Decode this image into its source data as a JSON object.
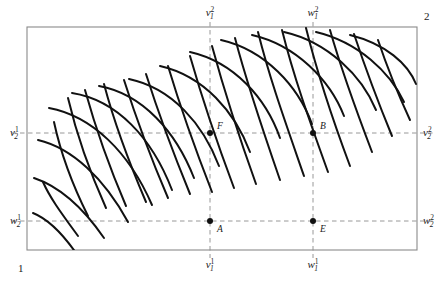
{
  "figure": {
    "frame": {
      "x": 27,
      "y": 27,
      "width": 390,
      "height": 223,
      "stroke": "#8a8a8a"
    },
    "colors": {
      "curve": "#111111",
      "dashed": "#8c8c8c",
      "frame": "#8a8a8a",
      "text": "#1a1a1a",
      "background": "#ffffff"
    },
    "corner_labels": [
      {
        "name": "origin-agent-1",
        "text": "1",
        "x": 18,
        "y": 272
      },
      {
        "name": "origin-agent-2",
        "text": "2",
        "x": 424,
        "y": 20
      }
    ],
    "axis_labels": {
      "top": [
        {
          "name": "v1-superscript-2",
          "base": "v",
          "sub": "1",
          "sup": "2",
          "x": 210,
          "y": 16
        },
        {
          "name": "w1-superscript-2",
          "base": "w",
          "sub": "1",
          "sup": "2",
          "x": 313,
          "y": 16
        }
      ],
      "bottom": [
        {
          "name": "v1-superscript-1",
          "base": "v",
          "sub": "1",
          "sup": "1",
          "x": 210,
          "y": 268
        },
        {
          "name": "w1-superscript-1",
          "base": "w",
          "sub": "1",
          "sup": "1",
          "x": 313,
          "y": 268
        }
      ],
      "left": [
        {
          "name": "v2-superscript-1",
          "base": "v",
          "sub": "2",
          "sup": "1",
          "x": 10,
          "y": 136
        },
        {
          "name": "w2-superscript-1",
          "base": "w",
          "sub": "2",
          "sup": "1",
          "x": 10,
          "y": 224
        }
      ],
      "right": [
        {
          "name": "v2-superscript-2",
          "base": "v",
          "sub": "2",
          "sup": "2",
          "x": 423,
          "y": 136
        },
        {
          "name": "w2-superscript-2",
          "base": "w",
          "sub": "2",
          "sup": "2",
          "x": 423,
          "y": 224
        }
      ]
    },
    "guide_lines": {
      "vertical": [
        {
          "name": "guide-v1",
          "x": 210,
          "y1": 22,
          "y2": 258
        },
        {
          "name": "guide-w1",
          "x": 313,
          "y1": 22,
          "y2": 258
        }
      ],
      "horizontal": [
        {
          "name": "guide-v2",
          "y": 133,
          "x1": 12,
          "x2": 433
        },
        {
          "name": "guide-w2",
          "y": 221,
          "x1": 12,
          "x2": 433
        }
      ]
    },
    "points": [
      {
        "name": "point-F",
        "label": "F",
        "x": 210,
        "y": 133,
        "dot": true,
        "lx": 217,
        "ly": 129
      },
      {
        "name": "point-B",
        "label": "B",
        "x": 313,
        "y": 133,
        "dot": true,
        "lx": 320,
        "ly": 129
      },
      {
        "name": "point-A",
        "label": "A",
        "x": 210,
        "y": 221,
        "dot": true,
        "lx": 217,
        "ly": 232
      },
      {
        "name": "point-E",
        "label": "E",
        "x": 313,
        "y": 221,
        "dot": true,
        "lx": 320,
        "ly": 232
      }
    ]
  },
  "chart_data": {
    "type": "line",
    "xlabel": "",
    "ylabel": "",
    "grid": false,
    "legend": null,
    "axis_ranges": {
      "x": [
        27,
        417
      ],
      "y": [
        27,
        250
      ]
    },
    "marked_x_values": [
      {
        "label": "v1",
        "pixel_x": 210
      },
      {
        "label": "w1",
        "pixel_x": 313
      }
    ],
    "marked_y_values": [
      {
        "label": "v2",
        "pixel_y": 133
      },
      {
        "label": "w2",
        "pixel_y": 221
      }
    ],
    "series": [
      {
        "name": "family-agent-1-shallow",
        "description": "Indifference curves of agent 1, concave, sweeping from upper-left down to lower-right",
        "curves": [
          "M 33 213 C 48 219 62 233 76 253",
          "M 34 178 C 58 186 82 206 104 238",
          "M 38 140 C 72 148 104 178 128 222",
          "M 49 108 C 92 116 129 152 152 205",
          "M 72 93 C 117 100 152 138 172 190",
          "M 99 86 C 143 94 176 132 194 178",
          "M 129 79 C 172 88 203 124 219 166",
          "M 160 66 C 204 76 235 112 250 152",
          "M 190 52 C 234 62 266 98 280 138",
          "M 221 40 C 265 50 298 86 312 124",
          "M 252 35 C 296 45 330 80 344 116",
          "M 284 32 C 328 42 362 76 376 110",
          "M 316 32 C 358 42 390 72 404 102",
          "M 350 35 C 386 44 408 64 416 84"
        ]
      },
      {
        "name": "family-agent-2-steep",
        "description": "Indifference curves of agent 2, convex, descending steeply from upper area to lower-left",
        "curves": [
          "M 43 182 C 50 198 62 214 78 236",
          "M 54 122 C 60 150 70 180 88 216",
          "M 68 98 C 76 132 88 168 106 208",
          "M 85 90 C 95 126 108 164 126 206",
          "M 104 84 C 114 122 128 160 146 202",
          "M 124 80 C 136 118 150 156 168 198",
          "M 146 74 C 158 112 172 150 190 194",
          "M 168 66 C 180 106 194 146 212 192",
          "M 190 56 C 202 98 216 140 234 188",
          "M 212 46 C 224 90 238 134 256 184",
          "M 235 38 C 247 84 262 128 280 180",
          "M 258 32 C 270 80 286 124 304 176",
          "M 282 30 C 294 78 310 122 328 172",
          "M 306 28 C 318 76 332 118 350 166",
          "M 330 30 C 342 72 356 110 372 152",
          "M 354 34 C 366 70 378 102 392 136",
          "M 378 40 C 388 70 398 94 410 120"
        ]
      }
    ]
  }
}
